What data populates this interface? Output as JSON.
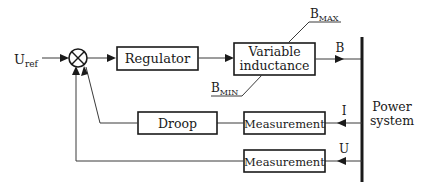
{
  "diagram": {
    "type": "block-diagram",
    "title": "",
    "input": {
      "label": "U",
      "subscript": "ref"
    },
    "summing_junction": {
      "symbol": "⊗"
    },
    "blocks": {
      "regulator": "Regulator",
      "variable_inductance_line1": "Variable",
      "variable_inductance_line2": "inductance",
      "droop": "Droop",
      "measurement_current": "Measurement",
      "measurement_voltage": "Measurement"
    },
    "limits": {
      "max": {
        "label": "B",
        "subscript": "MAX"
      },
      "min": {
        "label": "B",
        "subscript": "MIN"
      }
    },
    "signals": {
      "output": "B",
      "current": "I",
      "voltage": "U"
    },
    "power_system": {
      "line1": "Power",
      "line2": "system"
    },
    "colors": {
      "line": "#1a1a1a",
      "background": "#ffffff"
    }
  }
}
